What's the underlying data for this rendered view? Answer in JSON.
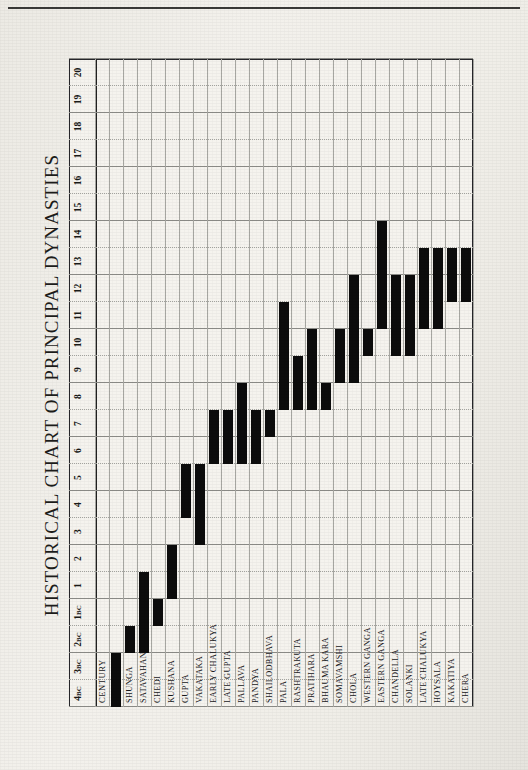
{
  "document": {
    "title": "HISTORICAL CHART OF PRINCIPAL DYNASTIES",
    "row_header_label": "CENTURY"
  },
  "chart_data": {
    "type": "bar",
    "orientation": "horizontal-rows-vertical-time-axis",
    "title": "HISTORICAL CHART OF PRINCIPAL DYNASTIES",
    "xlabel": "CENTURY",
    "ylabel": "",
    "axis_ticks": [
      "4BC",
      "3BC",
      "2BC",
      "1BC",
      "1",
      "2",
      "3",
      "4",
      "5",
      "6",
      "7",
      "8",
      "9",
      "10",
      "11",
      "12",
      "13",
      "14",
      "15",
      "16",
      "17",
      "18",
      "19",
      "20"
    ],
    "axis_range": [
      -4,
      20
    ],
    "grid": true,
    "legend": "none",
    "categories": [
      "MAURYA",
      "SHUNGA",
      "SATAVAHANA",
      "CHEDI",
      "KUSHANA",
      "GUPTA",
      "VAKATAKA",
      "EARLY CHALUKYA",
      "LATE GUPTA",
      "PALLAVA",
      "PANDYA",
      "SHAILODBHAVA",
      "PALA",
      "RASHTRAKUTA",
      "PRATIHARA",
      "BHAUMA KARA",
      "SOMAVAMSHI",
      "CHOLA",
      "WESTERN GANGA",
      "EASTERN GANGA",
      "CHANDELLA",
      "SOLANKI",
      "LATE CHALUKYA",
      "HOYSALA",
      "KAKATIYA",
      "CHERA"
    ],
    "series": [
      {
        "name": "Dynastic span (centuries)",
        "spans": [
          {
            "dynasty": "MAURYA",
            "start": -4,
            "end": -2
          },
          {
            "dynasty": "SHUNGA",
            "start": -2,
            "end": -1
          },
          {
            "dynasty": "SATAVAHANA",
            "start": -2,
            "end": 2
          },
          {
            "dynasty": "CHEDI",
            "start": -1,
            "end": 1
          },
          {
            "dynasty": "KUSHANA",
            "start": 1,
            "end": 3
          },
          {
            "dynasty": "GUPTA",
            "start": 4,
            "end": 6
          },
          {
            "dynasty": "VAKATAKA",
            "start": 3,
            "end": 6
          },
          {
            "dynasty": "EARLY CHALUKYA",
            "start": 6,
            "end": 8
          },
          {
            "dynasty": "LATE GUPTA",
            "start": 6,
            "end": 8
          },
          {
            "dynasty": "PALLAVA",
            "start": 6,
            "end": 9
          },
          {
            "dynasty": "PANDYA",
            "start": 6,
            "end": 8
          },
          {
            "dynasty": "SHAILODBHAVA",
            "start": 7,
            "end": 8
          },
          {
            "dynasty": "PALA",
            "start": 8,
            "end": 12
          },
          {
            "dynasty": "RASHTRAKUTA",
            "start": 8,
            "end": 10
          },
          {
            "dynasty": "PRATIHARA",
            "start": 8,
            "end": 11
          },
          {
            "dynasty": "BHAUMA KARA",
            "start": 8,
            "end": 9
          },
          {
            "dynasty": "SOMAVAMSHI",
            "start": 9,
            "end": 11
          },
          {
            "dynasty": "CHOLA",
            "start": 9,
            "end": 13
          },
          {
            "dynasty": "WESTERN GANGA",
            "start": 10,
            "end": 11
          },
          {
            "dynasty": "EASTERN GANGA",
            "start": 11,
            "end": 15
          },
          {
            "dynasty": "CHANDELLA",
            "start": 10,
            "end": 13
          },
          {
            "dynasty": "SOLANKI",
            "start": 10,
            "end": 13
          },
          {
            "dynasty": "LATE CHALUKYA",
            "start": 11,
            "end": 14
          },
          {
            "dynasty": "HOYSALA",
            "start": 11,
            "end": 14
          },
          {
            "dynasty": "KAKATIYA",
            "start": 12,
            "end": 14
          },
          {
            "dynasty": "CHERA",
            "start": 12,
            "end": 14
          }
        ]
      }
    ]
  },
  "colors": {
    "bar": "#0c0c0c",
    "paper": "#f0eee8",
    "rule": "#222222",
    "grid": "#8e8e8a"
  }
}
